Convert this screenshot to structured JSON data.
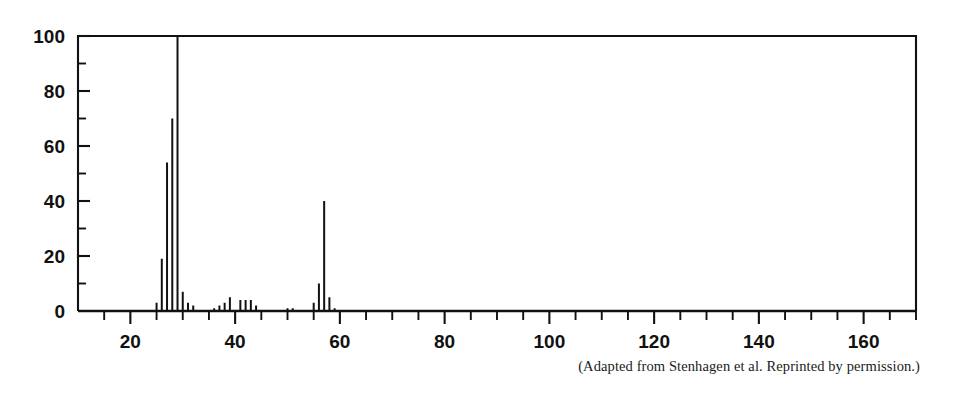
{
  "figure": {
    "caption": "(Adapted from Stenhagen et al. Reprinted by permission.)"
  },
  "chart_data": {
    "type": "bar",
    "title": "",
    "xlabel": "",
    "ylabel": "",
    "xlim": [
      10,
      170
    ],
    "ylim": [
      0,
      100
    ],
    "grid": false,
    "legend": "none",
    "x_major_ticks": [
      20,
      40,
      60,
      80,
      100,
      120,
      140,
      160
    ],
    "x_tick_labels": [
      "20",
      "40",
      "60",
      "80",
      "100",
      "120",
      "140",
      "160"
    ],
    "x_minor_tick_interval": 5,
    "y_major_ticks": [
      0,
      20,
      40,
      60,
      80,
      100
    ],
    "y_tick_labels": [
      "0",
      "20",
      "40",
      "60",
      "80",
      "100"
    ],
    "y_minor_tick_interval": 10,
    "x": [
      25,
      26,
      27,
      28,
      29,
      30,
      31,
      32,
      36,
      37,
      38,
      39,
      41,
      42,
      43,
      44,
      50,
      51,
      55,
      56,
      57,
      58,
      59
    ],
    "values": [
      3,
      19,
      54,
      70,
      100,
      7,
      3,
      2,
      1,
      2,
      3,
      5,
      4,
      4,
      4,
      2,
      1,
      1,
      3,
      10,
      40,
      5,
      1
    ],
    "series": [
      {
        "name": "relative intensity",
        "values": [
          3,
          19,
          54,
          70,
          100,
          7,
          3,
          2,
          1,
          2,
          3,
          5,
          4,
          4,
          4,
          2,
          1,
          1,
          3,
          10,
          40,
          5,
          1
        ]
      }
    ],
    "base_peak_mz": 29,
    "base_peak_value": 100
  }
}
